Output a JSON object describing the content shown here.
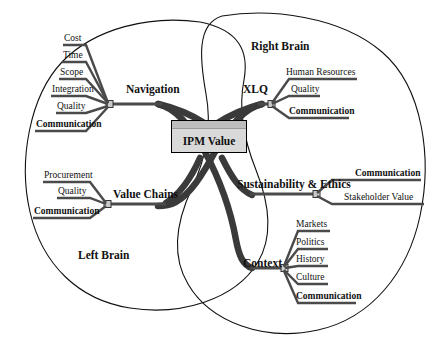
{
  "diagram": {
    "center": {
      "label": "IPM Value"
    },
    "regions": [
      {
        "name": "left-brain",
        "label": "Left Brain"
      },
      {
        "name": "right-brain",
        "label": "Right Brain"
      }
    ],
    "branches": [
      {
        "name": "navigation",
        "label": "Navigation",
        "side": "left",
        "twigs": [
          {
            "label": "Cost",
            "bold": false
          },
          {
            "label": "Time",
            "bold": false
          },
          {
            "label": "Scope",
            "bold": false
          },
          {
            "label": "Integration",
            "bold": false
          },
          {
            "label": "Quality",
            "bold": false
          },
          {
            "label": "Communication",
            "bold": true
          }
        ]
      },
      {
        "name": "value-chains",
        "label": "Value Chains",
        "side": "left",
        "twigs": [
          {
            "label": "Procurement",
            "bold": false
          },
          {
            "label": "Quality",
            "bold": false
          },
          {
            "label": "Communication",
            "bold": true
          }
        ]
      },
      {
        "name": "xlq",
        "label": "XLQ",
        "side": "right",
        "twigs": [
          {
            "label": "Human Resources",
            "bold": false
          },
          {
            "label": "Quality",
            "bold": false
          },
          {
            "label": "Communication",
            "bold": true
          }
        ]
      },
      {
        "name": "sustainability-ethics",
        "label": "Sustainability & Ethics",
        "side": "right",
        "twigs": [
          {
            "label": "Communication",
            "bold": true
          },
          {
            "label": "Stakeholder Value",
            "bold": false
          }
        ]
      },
      {
        "name": "context",
        "label": "Context",
        "side": "right",
        "twigs": [
          {
            "label": "Markets",
            "bold": false
          },
          {
            "label": "Politics",
            "bold": false
          },
          {
            "label": "History",
            "bold": false
          },
          {
            "label": "Culture",
            "bold": false
          },
          {
            "label": "Communication",
            "bold": true
          }
        ]
      }
    ],
    "colors": {
      "outline": "#111111",
      "trunk": "#3a3a3a",
      "branch": "#4a4a4a",
      "box_fill": "#d9d9d9",
      "box_cap": "#bdbdbd",
      "node_fill": "#c9c9c9",
      "text": "#111111",
      "background": "#ffffff"
    }
  }
}
